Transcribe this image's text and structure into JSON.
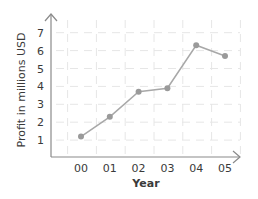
{
  "chart_data": {
    "type": "line",
    "title": "",
    "xlabel": "Year",
    "ylabel": "Profit in millions USD",
    "categories": [
      "00",
      "01",
      "02",
      "03",
      "04",
      "05"
    ],
    "series": [
      {
        "name": "Profit",
        "values": [
          1.2,
          2.3,
          3.7,
          3.9,
          6.3,
          5.7
        ]
      }
    ],
    "yticks": [
      1,
      2,
      3,
      4,
      5,
      6,
      7
    ],
    "ylim": [
      0,
      7.8
    ],
    "grid": true,
    "legend": "none",
    "colors": {
      "line": "#a8a8a8",
      "marker": "#9a9a9a",
      "axis": "#8a8a8a",
      "grid": "#e6e6e6",
      "text": "#3a3a3a"
    }
  }
}
